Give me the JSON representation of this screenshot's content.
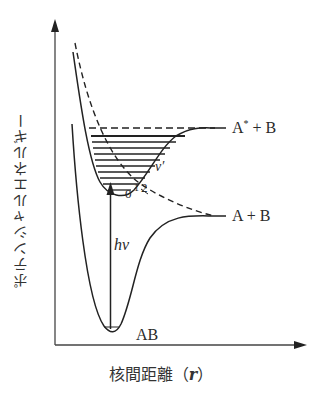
{
  "figure": {
    "type": "potential-energy-diagram",
    "y_axis_label": "ポテンシャルエネルギー",
    "x_axis_label": "核間距離（r）",
    "x_axis_label_main": "核間距離",
    "x_axis_label_var": "r",
    "curves": [
      {
        "name": "ground-state",
        "label": "AB",
        "style": "solid",
        "asymptote_label": "A + B"
      },
      {
        "name": "excited-state",
        "label": "A* + B",
        "style": "solid",
        "asymptote_label": "A* + B"
      },
      {
        "name": "repulsive-state",
        "style": "dashed",
        "asymptote_label": "A + B"
      }
    ],
    "labels": {
      "excited_asymptote": "A",
      "excited_asymptote_star": "*",
      "excited_asymptote_rest": " + B",
      "ground_asymptote": "A + B",
      "ground_state": "AB",
      "photon": "hν",
      "photon_h": "h",
      "photon_nu": "ν",
      "vib_quantum": "v′",
      "vib_levels": [
        "0",
        "1",
        "2"
      ]
    },
    "colors": {
      "line": "#222222",
      "axis": "#333333",
      "background": "#ffffff"
    }
  }
}
